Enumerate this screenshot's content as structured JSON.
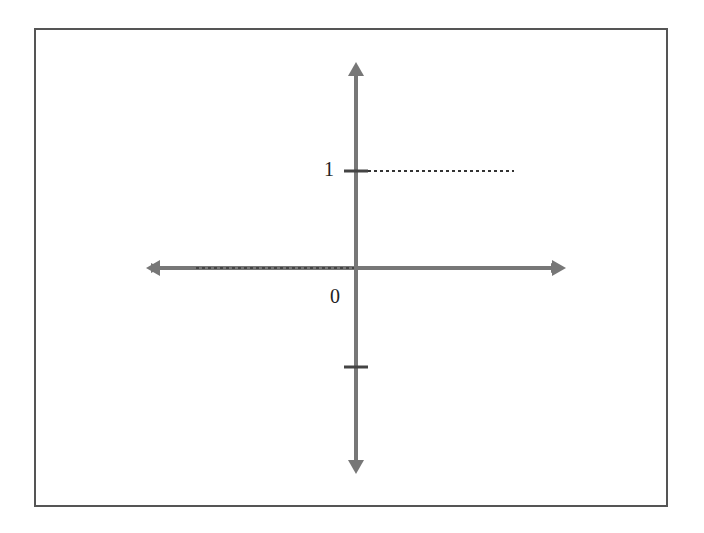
{
  "diagram": {
    "type": "number-line-axes",
    "axes": {
      "horizontal": {
        "arrows": "both",
        "color": "#777777"
      },
      "vertical": {
        "arrows": "both",
        "color": "#777777"
      }
    },
    "labels": {
      "one": "1",
      "zero": "0"
    },
    "ticks": [
      {
        "value": "1",
        "label": "1"
      },
      {
        "value": "-1",
        "label": ""
      }
    ],
    "dashed_lines": [
      {
        "description": "horizontal dashed line from y=1 tick to the right"
      },
      {
        "description": "horizontal dashed line along x-axis to the left of origin"
      }
    ]
  }
}
